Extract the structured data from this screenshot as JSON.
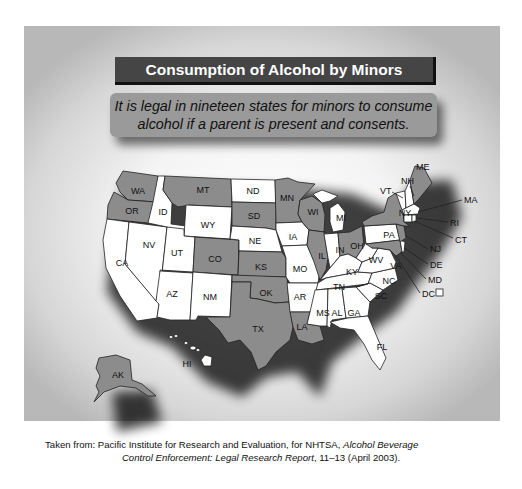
{
  "title": "Consumption of Alcohol by Minors",
  "subtitle_line1": "It is legal in nineteen states for minors to consume",
  "subtitle_line2": "alcohol if a parent is present and consents.",
  "legend": {
    "shaded_meaning": "Legal for minors to consume alcohol if a parent is present and consents",
    "dc_marker": "□"
  },
  "colors": {
    "shaded": "#8c8c8c",
    "unshaded": "#ffffff",
    "title_bar": "#454545",
    "subtitle_box": "#9a9a9a"
  },
  "states": {
    "WA": {
      "label": "WA",
      "shaded": true
    },
    "OR": {
      "label": "OR",
      "shaded": true
    },
    "CA": {
      "label": "CA",
      "shaded": false
    },
    "NV": {
      "label": "NV",
      "shaded": false
    },
    "ID": {
      "label": "ID",
      "shaded": false
    },
    "MT": {
      "label": "MT",
      "shaded": true
    },
    "WY": {
      "label": "WY",
      "shaded": false
    },
    "UT": {
      "label": "UT",
      "shaded": false
    },
    "AZ": {
      "label": "AZ",
      "shaded": false
    },
    "CO": {
      "label": "CO",
      "shaded": true
    },
    "NM": {
      "label": "NM",
      "shaded": false
    },
    "ND": {
      "label": "ND",
      "shaded": false
    },
    "SD": {
      "label": "SD",
      "shaded": true
    },
    "NE": {
      "label": "NE",
      "shaded": false
    },
    "KS": {
      "label": "KS",
      "shaded": true
    },
    "OK": {
      "label": "OK",
      "shaded": true
    },
    "TX": {
      "label": "TX",
      "shaded": true
    },
    "MN": {
      "label": "MN",
      "shaded": true
    },
    "IA": {
      "label": "IA",
      "shaded": false
    },
    "MO": {
      "label": "MO",
      "shaded": false
    },
    "AR": {
      "label": "AR",
      "shaded": false
    },
    "LA": {
      "label": "LA",
      "shaded": true
    },
    "WI": {
      "label": "WI",
      "shaded": true
    },
    "IL": {
      "label": "IL",
      "shaded": true
    },
    "MI": {
      "label": "MI",
      "shaded": false
    },
    "IN": {
      "label": "IN",
      "shaded": false
    },
    "OH": {
      "label": "OH",
      "shaded": true
    },
    "KY": {
      "label": "KY",
      "shaded": false
    },
    "TN": {
      "label": "TN",
      "shaded": false
    },
    "MS": {
      "label": "MS",
      "shaded": false
    },
    "AL": {
      "label": "AL",
      "shaded": false
    },
    "GA": {
      "label": "GA",
      "shaded": false
    },
    "FL": {
      "label": "FL",
      "shaded": false
    },
    "SC": {
      "label": "SC",
      "shaded": false
    },
    "NC": {
      "label": "NC",
      "shaded": false
    },
    "VA": {
      "label": "VA",
      "shaded": false
    },
    "WV": {
      "label": "WV",
      "shaded": false
    },
    "PA": {
      "label": "PA",
      "shaded": false
    },
    "NY": {
      "label": "NY",
      "shaded": true
    },
    "VT": {
      "label": "VT",
      "shaded": false
    },
    "NH": {
      "label": "NH",
      "shaded": false
    },
    "ME": {
      "label": "ME",
      "shaded": true
    },
    "MA": {
      "label": "MA",
      "shaded": false
    },
    "RI": {
      "label": "RI",
      "shaded": false
    },
    "CT": {
      "label": "CT",
      "shaded": false
    },
    "NJ": {
      "label": "NJ",
      "shaded": true
    },
    "DE": {
      "label": "DE",
      "shaded": false
    },
    "MD": {
      "label": "MD",
      "shaded": true
    },
    "DC": {
      "label": "DC",
      "shaded": false
    },
    "AK": {
      "label": "AK",
      "shaded": true
    },
    "HI": {
      "label": "HI",
      "shaded": false
    }
  },
  "source_line1_prefix": "Taken from: Pacific Institute for Research and Evaluation, for NHTSA, ",
  "source_line1_italic": "Alcohol Beverage",
  "source_line2_italic": "Control Enforcement: Legal Research Report",
  "source_line2_suffix": ", 11–13 (April 2003)."
}
